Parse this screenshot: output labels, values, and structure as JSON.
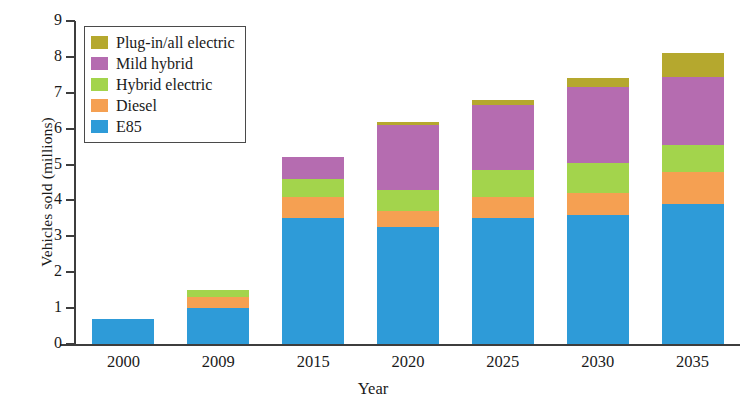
{
  "chart_data": {
    "type": "bar",
    "stacked": true,
    "title": "",
    "xlabel": "Year",
    "ylabel": "Vehicles sold (millions)",
    "categories": [
      "2000",
      "2009",
      "2015",
      "2020",
      "2025",
      "2030",
      "2035"
    ],
    "ylim": [
      0,
      9
    ],
    "yticks": [
      0,
      1,
      2,
      3,
      4,
      5,
      6,
      7,
      8,
      9
    ],
    "ytick_labels": [
      "0",
      "1",
      "2",
      "3",
      "4",
      "5",
      "6",
      "7",
      "8",
      "9"
    ],
    "grid": false,
    "legend_position": "top-left",
    "series": [
      {
        "name": "E85",
        "color": "#2e9bd8",
        "values": [
          0.7,
          1.0,
          3.5,
          3.25,
          3.5,
          3.6,
          3.9
        ]
      },
      {
        "name": "Diesel",
        "color": "#f5a052",
        "values": [
          0,
          0.3,
          0.6,
          0.45,
          0.6,
          0.6,
          0.9
        ]
      },
      {
        "name": "Hybrid electric",
        "color": "#a3d44c",
        "values": [
          0,
          0.2,
          0.5,
          0.6,
          0.75,
          0.85,
          0.75
        ]
      },
      {
        "name": "Mild hybrid",
        "color": "#b56cb0",
        "values": [
          0,
          0,
          0.6,
          1.8,
          1.8,
          2.1,
          1.9
        ]
      },
      {
        "name": "Plug-in/all electric",
        "color": "#b5a82e",
        "values": [
          0,
          0,
          0,
          0.1,
          0.15,
          0.25,
          0.65
        ]
      }
    ],
    "totals": [
      0.7,
      1.5,
      5.2,
      6.2,
      6.8,
      7.4,
      8.1
    ]
  },
  "legend": {
    "entries": [
      {
        "label": "Plug-in/all electric",
        "color": "#b5a82e"
      },
      {
        "label": "Mild hybrid",
        "color": "#b56cb0"
      },
      {
        "label": "Hybrid electric",
        "color": "#a3d44c"
      },
      {
        "label": "Diesel",
        "color": "#f5a052"
      },
      {
        "label": "E85",
        "color": "#2e9bd8"
      }
    ]
  },
  "axes": {
    "y_title": "Vehicles sold (millions)",
    "x_title": "Year"
  }
}
